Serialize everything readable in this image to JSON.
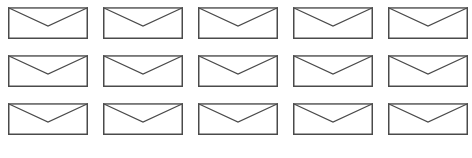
{
  "icon": "envelope-icon",
  "stroke_color": "#4a4a4a",
  "top_edge_color": "#777777",
  "background": "#ffffff",
  "grid": {
    "rows": 3,
    "columns": 5,
    "column_x": [
      8,
      103,
      198,
      293,
      388
    ],
    "row_y": [
      7,
      55,
      103
    ],
    "icon_width": 80,
    "icon_height": 32
  },
  "envelopes": [
    {
      "row": 1,
      "col": 1
    },
    {
      "row": 1,
      "col": 2
    },
    {
      "row": 1,
      "col": 3
    },
    {
      "row": 1,
      "col": 4
    },
    {
      "row": 1,
      "col": 5
    },
    {
      "row": 2,
      "col": 1
    },
    {
      "row": 2,
      "col": 2
    },
    {
      "row": 2,
      "col": 3
    },
    {
      "row": 2,
      "col": 4
    },
    {
      "row": 2,
      "col": 5
    },
    {
      "row": 3,
      "col": 1
    },
    {
      "row": 3,
      "col": 2
    },
    {
      "row": 3,
      "col": 3
    },
    {
      "row": 3,
      "col": 4
    },
    {
      "row": 3,
      "col": 5
    }
  ]
}
